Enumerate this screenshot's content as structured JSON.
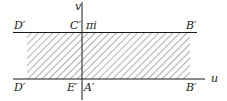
{
  "diagram": {
    "type": "complex-plane-strip",
    "colors": {
      "line": "#1a1a1a",
      "hatch": "#333333",
      "background": "#ffffff"
    },
    "axes": {
      "horizontal_label": "u",
      "vertical_label": "v"
    },
    "top_boundary": {
      "left_label": "D′",
      "axis_label": "C′",
      "value_label": "πi",
      "right_label": "B′"
    },
    "bottom_boundary": {
      "left_label": "D′",
      "axis_left_label": "E′",
      "axis_right_label": "A′",
      "right_label": "B′"
    },
    "region": {
      "fill": "diagonal-hatch",
      "meaning": "image strip"
    }
  }
}
